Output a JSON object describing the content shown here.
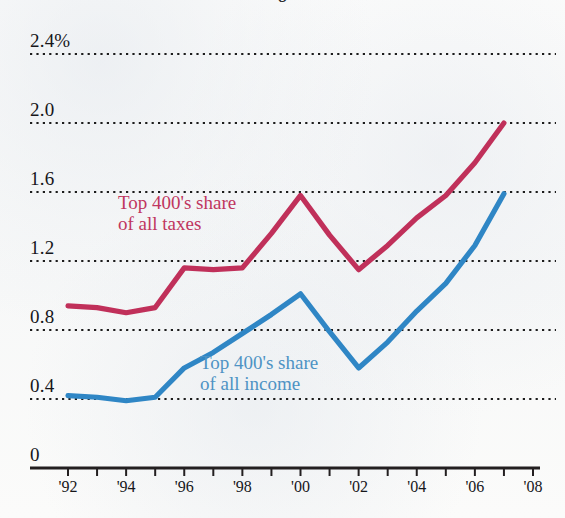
{
  "figure": {
    "clipped_title_fragment": "g",
    "background_color": "#fbfbfa"
  },
  "colors": {
    "taxes_line": "#c0305a",
    "income_line": "#2f86c5",
    "axis": "#231f20",
    "gridline": "#1c1c1c",
    "taxes_label": "#c0365f",
    "income_label": "#4e93c4"
  },
  "annotations": {
    "taxes": {
      "line1": "Top 400's share",
      "line2": "of all taxes"
    },
    "income": {
      "line1": "Top 400's share",
      "line2": "of all income"
    }
  },
  "chart_data": {
    "type": "line",
    "title": "",
    "subtitle": "",
    "xlabel": "",
    "ylabel": "",
    "grid": true,
    "legend_position": "inline-annotations",
    "xlim": [
      1992,
      2008
    ],
    "ylim": [
      0,
      2.4
    ],
    "y_tick_labels": [
      "2.4%",
      "2.0",
      "1.6",
      "1.2",
      "0.8",
      "0.4",
      "0"
    ],
    "y_ticks": [
      2.4,
      2.0,
      1.6,
      1.2,
      0.8,
      0.4,
      0
    ],
    "x_tick_labels": [
      "'92",
      "'94",
      "'96",
      "'98",
      "'00",
      "'02",
      "'04",
      "'06",
      "'08"
    ],
    "x_ticks": [
      1992,
      1994,
      1996,
      1998,
      2000,
      2002,
      2004,
      2006,
      2008
    ],
    "x_minor_ticks": [
      1993,
      1995,
      1997,
      1999,
      2001,
      2003,
      2005,
      2007
    ],
    "x": [
      1992,
      1993,
      1994,
      1995,
      1996,
      1997,
      1998,
      1999,
      2000,
      2001,
      2002,
      2003,
      2004,
      2005,
      2006,
      2007
    ],
    "series": [
      {
        "name": "Top 400's share of all taxes",
        "color": "#c0305a",
        "values": [
          0.94,
          0.93,
          0.9,
          0.93,
          1.16,
          1.15,
          1.16,
          1.36,
          1.58,
          1.35,
          1.15,
          1.29,
          1.45,
          1.58,
          1.77,
          2.0
        ]
      },
      {
        "name": "Top 400's share of all income",
        "color": "#2f86c5",
        "values": [
          0.42,
          0.41,
          0.39,
          0.41,
          0.58,
          0.67,
          0.78,
          0.89,
          1.01,
          0.79,
          0.58,
          0.73,
          0.91,
          1.07,
          1.29,
          1.59
        ]
      }
    ]
  }
}
